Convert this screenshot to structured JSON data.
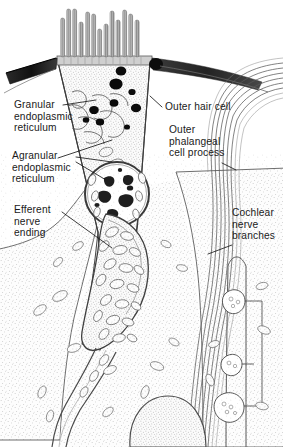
{
  "figure": {
    "width": 283,
    "height": 447,
    "background_color": "#ffffff",
    "ink_color": "#1a1a1a",
    "style": "pen-and-ink stipple anatomical drawing"
  },
  "labels": [
    {
      "id": "granular-endoplasmic-reticulum",
      "text": "Granular\nendoplasmic\nreticulum",
      "side": "left",
      "x": 14,
      "y": 101
    },
    {
      "id": "agranular-endoplasmic-reticulum",
      "text": "Agranular\nendoplasmic\nreticulum",
      "side": "left",
      "x": 12,
      "y": 152
    },
    {
      "id": "efferent-nerve-ending",
      "text": "Efferent\nnerve\nending",
      "side": "left",
      "x": 14,
      "y": 206
    },
    {
      "id": "outer-hair-cell",
      "text": "Outer hair cell",
      "side": "right",
      "x": 163,
      "y": 103
    },
    {
      "id": "outer-phalangeal-cell-process",
      "text": "Outer\nphalangeal\ncell process",
      "side": "right",
      "x": 168,
      "y": 126
    },
    {
      "id": "cochlear-nerve-branches",
      "text": "Cochlear\nnerve\nbranches",
      "side": "right",
      "x": 232,
      "y": 209
    }
  ],
  "structures": [
    {
      "id": "stereocilia",
      "name": "Stereocilia bundle",
      "count": 13,
      "region": "apex"
    },
    {
      "id": "cuticular-plate",
      "name": "Cuticular plate",
      "region": "apex"
    },
    {
      "id": "tight-junction-left",
      "name": "Tight junction (left)",
      "region": "apex-left"
    },
    {
      "id": "tight-junction-right",
      "name": "Tight junction (right)",
      "region": "apex-right"
    },
    {
      "id": "dark-granules",
      "name": "Dense granules / lysosomes",
      "count": 9,
      "region": "apical cytoplasm"
    },
    {
      "id": "nucleus",
      "name": "Nucleus with chromatin clumps",
      "region": "mid cell"
    },
    {
      "id": "mitochondria",
      "name": "Mitochondria",
      "region": "basal cytoplasm"
    },
    {
      "id": "efferent-ending-body",
      "name": "Efferent nerve ending",
      "region": "cell base"
    },
    {
      "id": "nerve-fiber-bundle",
      "name": "Cochlear nerve fiber bundle",
      "region": "right"
    },
    {
      "id": "phalangeal-process",
      "name": "Outer phalangeal cell process",
      "region": "right column"
    },
    {
      "id": "nerve-boutons",
      "name": "Nerve endings / boutons",
      "count": 3,
      "region": "lower right"
    },
    {
      "id": "supporting-cell-nucleus",
      "name": "Supporting cell nucleus",
      "region": "bottom"
    }
  ]
}
